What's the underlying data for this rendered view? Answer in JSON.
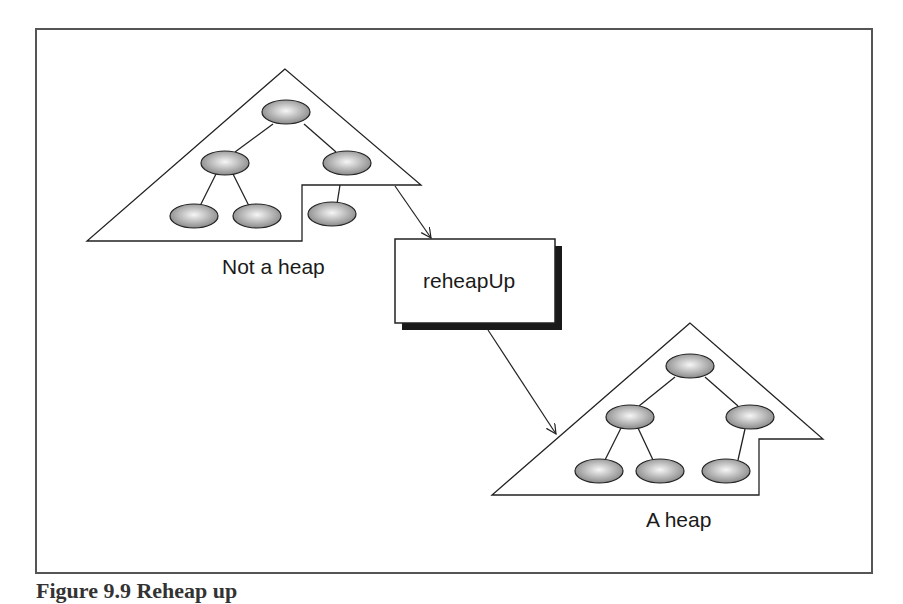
{
  "diagram": {
    "left_label": "Not a heap",
    "process_label": "reheapUp",
    "right_label": "A heap",
    "caption": "Figure 9.9   Reheap up"
  },
  "colors": {
    "frame": "#444444",
    "line": "#222222",
    "node_light": "#f4f4f4",
    "node_dark": "#8a8a8a",
    "shadow": "#1a1a1a"
  }
}
